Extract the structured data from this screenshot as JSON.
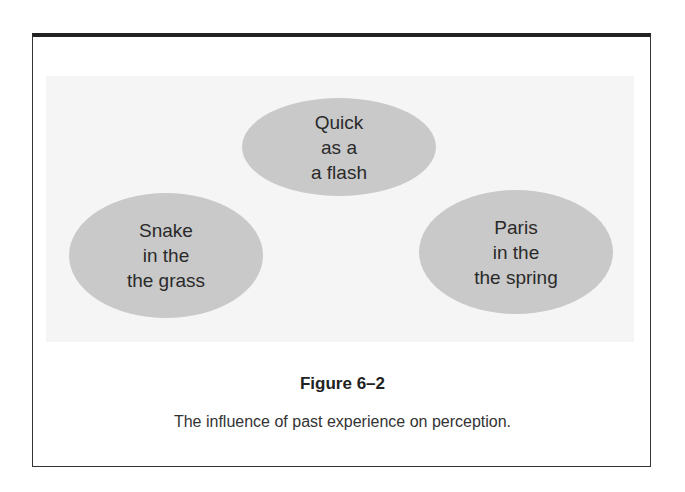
{
  "diagram": {
    "ellipses": [
      {
        "lines": [
          "Quick",
          "as a",
          "a flash"
        ]
      },
      {
        "lines": [
          "Snake",
          "in the",
          "the grass"
        ]
      },
      {
        "lines": [
          "Paris",
          "in the",
          "the spring"
        ]
      }
    ],
    "colors": {
      "ellipse_fill": "#c9c9c9",
      "panel_bg": "#f5f5f5",
      "border": "#222222"
    }
  },
  "figure": {
    "title": "Figure 6–2",
    "caption": "The influence of past experience on perception."
  }
}
